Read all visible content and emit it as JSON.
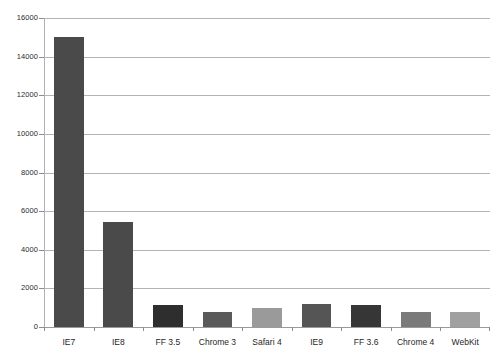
{
  "chart_data": {
    "type": "bar",
    "title": "",
    "subtitle": "",
    "xlabel": "",
    "ylabel": "",
    "categories": [
      "IE7",
      "IE8",
      "FF 3.5",
      "Chrome 3",
      "Safari 4",
      "IE9",
      "FF 3.6",
      "Chrome 4",
      "WebKit"
    ],
    "values": [
      15000,
      5450,
      1150,
      800,
      1000,
      1200,
      1150,
      800,
      780
    ],
    "bar_colors": [
      "#4a4a4a",
      "#4a4a4a",
      "#2e2e2e",
      "#5a5a5a",
      "#9a9a9a",
      "#555555",
      "#363636",
      "#7a7a7a",
      "#a0a0a0"
    ],
    "ylim": [
      0,
      16000
    ],
    "yticks": [
      0,
      2000,
      4000,
      6000,
      8000,
      10000,
      12000,
      14000,
      16000
    ],
    "ytick_labels": [
      "0",
      "2000",
      "4000",
      "6000",
      "8000",
      "10000",
      "12000",
      "14000",
      "16000"
    ],
    "grid": true,
    "legend": "none",
    "background_color": "#ffffff",
    "gridline_color": "#b4b4b4"
  }
}
